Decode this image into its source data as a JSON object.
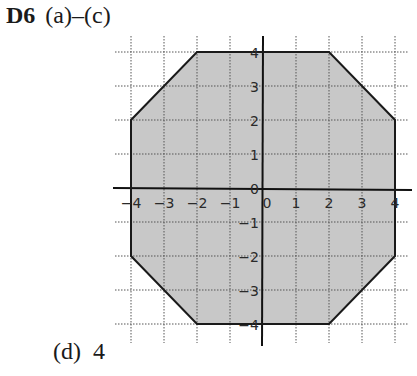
{
  "heading": {
    "label": "D6",
    "parts": "(a)–(c)"
  },
  "answer": {
    "part": "(d)",
    "value": "4"
  },
  "chart_data": {
    "type": "polygon-on-grid",
    "x_range": [
      -4,
      4
    ],
    "y_range": [
      -4,
      4
    ],
    "x_ticks": [
      "-4",
      "-3",
      "-2",
      "-1",
      "0",
      "1",
      "2",
      "3",
      "4"
    ],
    "y_ticks": [
      "4",
      "3",
      "2",
      "1",
      "0",
      "-1",
      "-2",
      "-3",
      "-4"
    ],
    "grid": true,
    "shape": "octagon",
    "vertices": [
      [
        -2,
        4
      ],
      [
        2,
        4
      ],
      [
        4,
        2
      ],
      [
        4,
        -2
      ],
      [
        2,
        -4
      ],
      [
        -2,
        -4
      ],
      [
        -4,
        -2
      ],
      [
        -4,
        2
      ]
    ],
    "fill_color": "#c8c8c8",
    "stroke_color": "#1a1a1a"
  }
}
